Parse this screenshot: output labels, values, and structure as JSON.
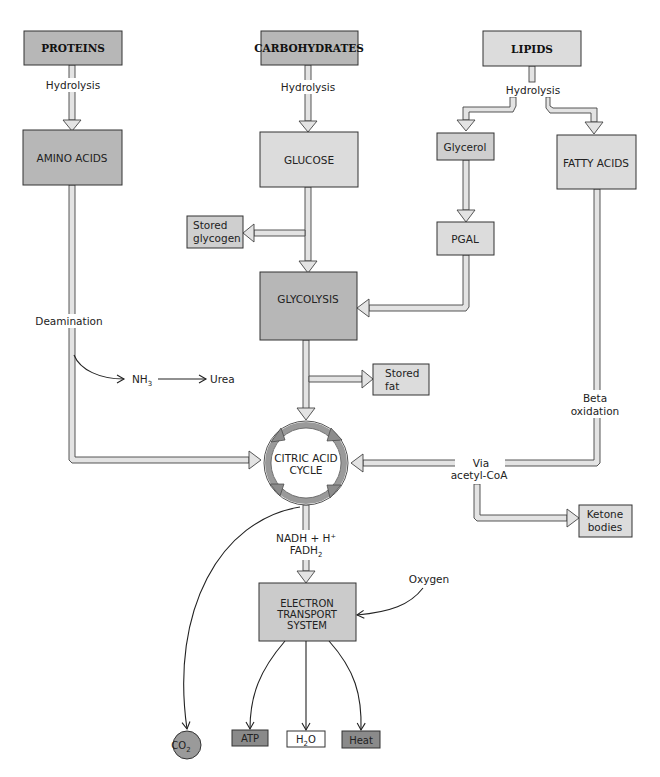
{
  "diagram": {
    "title": "",
    "colors": {
      "dark_box": "#b7b7b7",
      "light_box": "#dcdcdc",
      "white_box": "#ffffff",
      "pipe_fill": "#e3e3e3",
      "stroke": "#333333",
      "cycle_ring": "#9a9a9a"
    },
    "nodes": {
      "proteins": "PROTEINS",
      "carbohydrates": "CARBOHYDRATES",
      "lipids": "LIPIDS",
      "amino_acids": "AMINO ACIDS",
      "glucose": "GLUCOSE",
      "glycerol": "Glycerol",
      "fatty_acids": "FATTY ACIDS",
      "pgal": "PGAL",
      "stored_glycogen_1": "Stored",
      "stored_glycogen_2": "glycogen",
      "glycolysis": "GLYCOLYSIS",
      "stored_fat_1": "Stored",
      "stored_fat_2": "fat",
      "citric_1": "CITRIC ACID",
      "citric_2": "CYCLE",
      "ketone_1": "Ketone",
      "ketone_2": "bodies",
      "ets_1": "ELECTRON",
      "ets_2": "TRANSPORT",
      "ets_3": "SYSTEM",
      "co2": "CO",
      "co2_sub": "2",
      "atp": "ATP",
      "h2o_h": "H",
      "h2o_sub": "2",
      "h2o_o": "O",
      "heat": "Heat"
    },
    "labels": {
      "hydrolysis_proteins": "Hydrolysis",
      "hydrolysis_carbs": "Hydrolysis",
      "hydrolysis_lipids": "Hydrolysis",
      "deamination": "Deamination",
      "nh3": "NH",
      "nh3_sub": "3",
      "urea": "Urea",
      "beta_1": "Beta",
      "beta_2": "oxidation",
      "via_1": "Via",
      "via_2": "acetyl-CoA",
      "nadh": "NADH + H⁺",
      "fadh": "FADH",
      "fadh_sub": "2",
      "oxygen": "Oxygen"
    }
  }
}
